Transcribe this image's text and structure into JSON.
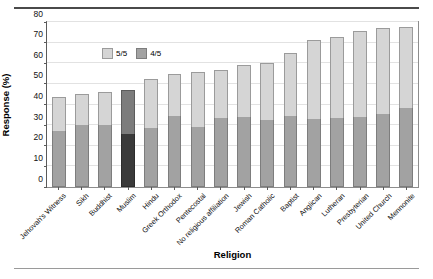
{
  "chart_data": {
    "type": "bar",
    "stacked": true,
    "title": "",
    "xlabel": "Religion",
    "ylabel": "Response (%)",
    "ylim": [
      0,
      80
    ],
    "yticks": [
      0,
      10,
      20,
      30,
      40,
      50,
      60,
      70,
      80
    ],
    "grid": true,
    "legend_position": "top-left",
    "categories": [
      "Jehovah's Witness",
      "Sikh",
      "Buddhist",
      "Muslim",
      "Hindu",
      "Greek Orthodox",
      "Pentecostal",
      "No religious affiliation",
      "Jewish",
      "Roman Catholic",
      "Baptist",
      "Anglican",
      "Lutheran",
      "Presbyterian",
      "United Church",
      "Mennonite"
    ],
    "series": [
      {
        "name": "4/5",
        "color": "#a2a2a2",
        "values": [
          27,
          30,
          30,
          25.5,
          28.5,
          34.5,
          29,
          33.5,
          34,
          32.5,
          34.5,
          33,
          33.5,
          34,
          35.5,
          38.5
        ]
      },
      {
        "name": "5/5",
        "color": "#d5d5d5",
        "values": [
          16.5,
          15,
          16,
          21.5,
          24,
          20.5,
          27,
          23,
          25,
          27.5,
          30.5,
          38.5,
          39,
          41.5,
          41.5,
          39
        ]
      }
    ],
    "totals": [
      43.5,
      45,
      46,
      47,
      52.5,
      55,
      56,
      56.5,
      59,
      60,
      65,
      71.5,
      72.5,
      75.5,
      77,
      77.5
    ],
    "highlighted_category": "Muslim",
    "highlight_colors": {
      "4/5": "#3a3a3a",
      "5/5": "#7c7c7c"
    }
  },
  "legend": {
    "items": [
      {
        "label": "5/5"
      },
      {
        "label": "4/5"
      }
    ]
  }
}
